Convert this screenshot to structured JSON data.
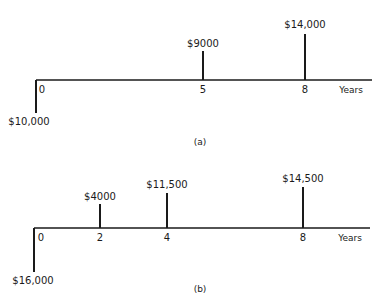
{
  "diagrams": [
    {
      "id": "a",
      "caption": "(a)",
      "axis_label": "Years",
      "axis": {
        "y": 80,
        "x_start": 36,
        "x_end": 372
      },
      "year_positions": {
        "0": 36,
        "5": 203,
        "8": 305
      },
      "tick_labels": [
        {
          "label": "0",
          "x": 42,
          "y": 93
        },
        {
          "label": "5",
          "x": 203,
          "y": 93
        },
        {
          "label": "8",
          "x": 305,
          "y": 93
        }
      ],
      "flows": [
        {
          "year": 0,
          "amount": "$10,000",
          "direction": "down",
          "x": 36,
          "y_end": 113,
          "label_x": 29,
          "label_y": 125
        },
        {
          "year": 5,
          "amount": "$9000",
          "direction": "up",
          "x": 203,
          "y_end": 51,
          "label_x": 203,
          "label_y": 47
        },
        {
          "year": 8,
          "amount": "$14,000",
          "direction": "up",
          "x": 305,
          "y_end": 34,
          "label_x": 305,
          "label_y": 28
        }
      ],
      "axis_label_pos": {
        "x": 351,
        "y": 93
      },
      "caption_pos": {
        "x": 200,
        "y": 145
      }
    },
    {
      "id": "b",
      "caption": "(b)",
      "axis_label": "Years",
      "axis": {
        "y": 228,
        "x_start": 34,
        "x_end": 370
      },
      "year_positions": {
        "0": 34,
        "2": 100,
        "4": 167,
        "8": 303
      },
      "tick_labels": [
        {
          "label": "0",
          "x": 41,
          "y": 241
        },
        {
          "label": "2",
          "x": 100,
          "y": 241
        },
        {
          "label": "4",
          "x": 167,
          "y": 241
        },
        {
          "label": "8",
          "x": 303,
          "y": 241
        }
      ],
      "flows": [
        {
          "year": 0,
          "amount": "$16,000",
          "direction": "down",
          "x": 34,
          "y_end": 272,
          "label_x": 33,
          "label_y": 284
        },
        {
          "year": 2,
          "amount": "$4000",
          "direction": "up",
          "x": 100,
          "y_end": 204,
          "label_x": 100,
          "label_y": 200
        },
        {
          "year": 4,
          "amount": "$11,500",
          "direction": "up",
          "x": 167,
          "y_end": 193,
          "label_x": 167,
          "label_y": 188
        },
        {
          "year": 8,
          "amount": "$14,500",
          "direction": "up",
          "x": 303,
          "y_end": 187,
          "label_x": 303,
          "label_y": 182
        }
      ],
      "axis_label_pos": {
        "x": 350,
        "y": 241
      },
      "caption_pos": {
        "x": 200,
        "y": 292
      }
    }
  ]
}
